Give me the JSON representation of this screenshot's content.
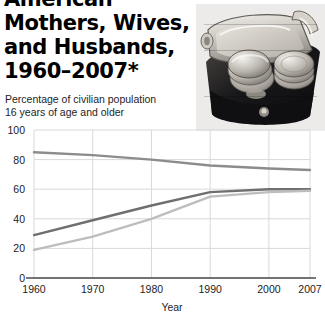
{
  "headline": {
    "line_cropped": "American Mothers, Wives,",
    "text": "American Mothers, Wives,\nand Husbands,\n1960–2007*"
  },
  "photo": {
    "name": "coin-purse-photo",
    "description": "Black and white photograph of an open metal-clasp coin purse filled with coins"
  },
  "subtitle": {
    "text": "Percentage of civilian population\n16 years of age and older"
  },
  "colors": {
    "ink": "#000000",
    "grid": "#d9d9d9",
    "axis": "#4a4a4a",
    "series_husbands": "#8c8c8c",
    "series_mothers": "#6f6f6f",
    "series_wives": "#bdbdbd",
    "overlay_line": "#ffffff"
  },
  "chart_data": {
    "type": "line",
    "title": "",
    "xlabel": "Year",
    "ylabel": "",
    "ylabel_note": "Percentage of civilian population 16 years of age and older",
    "x": [
      1960,
      1970,
      1980,
      1990,
      2000,
      2007
    ],
    "xticklabels": [
      "1960",
      "1970",
      "1980",
      "1990",
      "2000",
      "2007"
    ],
    "yticklabels": [
      "0",
      "20",
      "40",
      "60",
      "80",
      "100"
    ],
    "yticks": [
      0,
      20,
      40,
      60,
      80,
      100
    ],
    "xlim": [
      1960,
      2007
    ],
    "ylim": [
      0,
      100
    ],
    "grid": true,
    "legend": "none",
    "series": [
      {
        "name": "Husbands",
        "color": "#8c8c8c",
        "values": [
          85,
          83,
          80,
          76,
          74,
          73
        ]
      },
      {
        "name": "Mothers",
        "color": "#6f6f6f",
        "values": [
          29,
          39,
          49,
          58,
          60,
          60
        ]
      },
      {
        "name": "Wives",
        "color": "#bdbdbd",
        "values": [
          19,
          28,
          40,
          55,
          58,
          59
        ]
      }
    ]
  }
}
